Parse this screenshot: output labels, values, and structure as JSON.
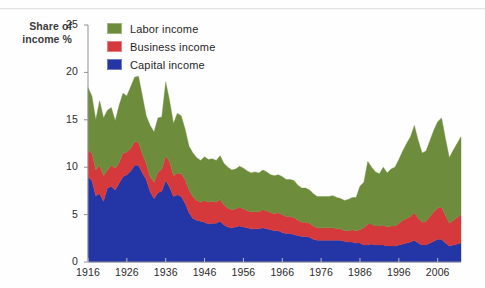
{
  "figure": {
    "y_axis_label_line1": "Share of",
    "y_axis_label_line2": "income %"
  },
  "legend": {
    "position": "top-left-inside",
    "items": [
      {
        "label": "Labor income",
        "color": "#6d8c3c",
        "icon": "legend-swatch"
      },
      {
        "label": "Business income",
        "color": "#d6393b",
        "icon": "legend-swatch"
      },
      {
        "label": "Capital income",
        "color": "#2436a6",
        "icon": "legend-swatch"
      }
    ]
  },
  "chart_data": {
    "type": "area",
    "stacked": true,
    "title": "",
    "subtitle": "",
    "xlabel": "",
    "ylabel": "Share of income %",
    "xlim": [
      1916,
      2012
    ],
    "ylim": [
      0,
      25
    ],
    "grid": false,
    "y_ticks": [
      0,
      5,
      10,
      15,
      20,
      25
    ],
    "x_ticks": [
      1916,
      1926,
      1936,
      1946,
      1956,
      1966,
      1976,
      1986,
      1996,
      2006
    ],
    "x": [
      1916,
      1917,
      1918,
      1919,
      1920,
      1921,
      1922,
      1923,
      1924,
      1925,
      1926,
      1927,
      1928,
      1929,
      1930,
      1931,
      1932,
      1933,
      1934,
      1935,
      1936,
      1937,
      1938,
      1939,
      1940,
      1941,
      1942,
      1943,
      1944,
      1945,
      1946,
      1947,
      1948,
      1949,
      1950,
      1951,
      1952,
      1953,
      1954,
      1955,
      1956,
      1957,
      1958,
      1959,
      1960,
      1961,
      1962,
      1963,
      1964,
      1965,
      1966,
      1967,
      1968,
      1969,
      1970,
      1971,
      1972,
      1973,
      1974,
      1975,
      1976,
      1977,
      1978,
      1979,
      1980,
      1981,
      1982,
      1983,
      1984,
      1985,
      1986,
      1987,
      1988,
      1989,
      1990,
      1991,
      1992,
      1993,
      1994,
      1995,
      1996,
      1997,
      1998,
      1999,
      2000,
      2001,
      2002,
      2003,
      2004,
      2005,
      2006,
      2007,
      2008,
      2009,
      2010,
      2011,
      2012
    ],
    "series": [
      {
        "name": "Capital income",
        "color": "#2436a6",
        "values": [
          9.0,
          8.6,
          7.0,
          7.2,
          6.4,
          7.8,
          8.0,
          7.6,
          8.3,
          9.0,
          9.2,
          9.6,
          10.2,
          10.2,
          9.4,
          8.7,
          7.4,
          6.7,
          7.3,
          7.5,
          8.6,
          7.9,
          6.9,
          7.1,
          6.9,
          6.2,
          5.2,
          4.6,
          4.4,
          4.3,
          4.2,
          4.0,
          4.1,
          4.1,
          4.3,
          3.9,
          3.7,
          3.6,
          3.7,
          3.8,
          3.7,
          3.6,
          3.5,
          3.5,
          3.5,
          3.6,
          3.5,
          3.4,
          3.3,
          3.3,
          3.1,
          3.0,
          3.0,
          2.9,
          2.8,
          2.7,
          2.7,
          2.6,
          2.4,
          2.3,
          2.3,
          2.3,
          2.3,
          2.3,
          2.3,
          2.3,
          2.2,
          2.1,
          2.1,
          2.0,
          2.0,
          1.8,
          1.8,
          1.9,
          1.8,
          1.8,
          1.8,
          1.7,
          1.7,
          1.7,
          1.8,
          1.9,
          2.0,
          2.1,
          2.3,
          2.0,
          1.8,
          1.8,
          2.0,
          2.2,
          2.4,
          2.4,
          2.0,
          1.7,
          1.8,
          1.9,
          2.0
        ]
      },
      {
        "name": "Business income",
        "color": "#d6393b",
        "values": [
          2.8,
          2.9,
          2.7,
          3.0,
          2.7,
          1.9,
          2.2,
          2.3,
          2.2,
          2.5,
          2.4,
          2.4,
          2.5,
          2.4,
          2.0,
          1.7,
          1.6,
          1.7,
          2.2,
          2.3,
          2.6,
          2.7,
          2.2,
          2.3,
          2.4,
          2.5,
          2.4,
          2.3,
          2.1,
          2.0,
          2.3,
          2.3,
          2.3,
          2.2,
          2.3,
          2.1,
          2.0,
          1.9,
          1.9,
          2.0,
          1.9,
          1.8,
          1.8,
          1.8,
          1.8,
          1.9,
          1.9,
          1.8,
          1.8,
          1.9,
          1.9,
          1.8,
          1.8,
          1.8,
          1.6,
          1.5,
          1.5,
          1.5,
          1.4,
          1.3,
          1.3,
          1.3,
          1.3,
          1.3,
          1.2,
          1.2,
          1.1,
          1.2,
          1.3,
          1.3,
          1.4,
          1.8,
          2.2,
          2.1,
          2.0,
          2.0,
          2.1,
          2.0,
          2.1,
          2.1,
          2.3,
          2.5,
          2.6,
          2.7,
          2.9,
          2.6,
          2.4,
          2.5,
          2.8,
          3.1,
          3.3,
          3.4,
          2.9,
          2.4,
          2.6,
          2.8,
          3.0
        ]
      },
      {
        "name": "Labor income",
        "color": "#6d8c3c",
        "values": [
          6.6,
          6.0,
          5.3,
          6.8,
          6.1,
          6.3,
          6.1,
          5.0,
          6.0,
          6.3,
          5.9,
          6.5,
          6.8,
          7.0,
          6.1,
          5.0,
          5.4,
          5.3,
          5.7,
          5.5,
          7.8,
          6.4,
          5.5,
          6.3,
          6.1,
          5.3,
          4.6,
          4.6,
          4.5,
          4.4,
          4.6,
          4.5,
          4.5,
          4.4,
          4.6,
          4.4,
          4.3,
          4.2,
          4.2,
          4.3,
          4.3,
          4.2,
          4.1,
          4.2,
          4.1,
          4.2,
          4.1,
          4.0,
          4.0,
          4.0,
          4.0,
          3.9,
          3.9,
          3.9,
          3.7,
          3.6,
          3.6,
          3.5,
          3.4,
          3.3,
          3.3,
          3.3,
          3.3,
          3.4,
          3.3,
          3.2,
          3.2,
          3.3,
          3.4,
          3.5,
          4.6,
          4.8,
          6.6,
          6.0,
          5.7,
          5.5,
          6.1,
          5.7,
          6.0,
          6.2,
          6.7,
          7.3,
          7.9,
          8.4,
          9.2,
          8.2,
          7.3,
          7.4,
          8.0,
          8.6,
          9.1,
          9.4,
          8.1,
          6.9,
          7.4,
          7.8,
          8.2
        ]
      }
    ]
  }
}
